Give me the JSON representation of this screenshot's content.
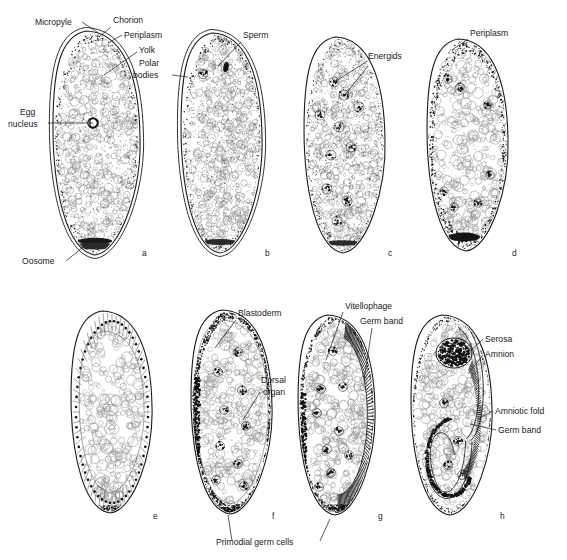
{
  "figure": {
    "background": "#ffffff",
    "ink": "#1a1a1a"
  },
  "panels": [
    {
      "id": "a",
      "letter": "a",
      "cx": 97,
      "cy": 143,
      "rx": 43,
      "ry": 112,
      "letter_x": 142,
      "letter_y": 256,
      "stage": "fertilized egg with egg nucleus and oosome"
    },
    {
      "id": "b",
      "letter": "b",
      "cx": 222,
      "cy": 143,
      "rx": 40,
      "ry": 110,
      "letter_x": 265,
      "letter_y": 256,
      "stage": "sperm entry and polar bodies"
    },
    {
      "id": "c",
      "letter": "c",
      "cx": 345,
      "cy": 145,
      "rx": 40,
      "ry": 108,
      "letter_x": 388,
      "letter_y": 256,
      "stage": "cleavage energids"
    },
    {
      "id": "d",
      "letter": "d",
      "cx": 468,
      "cy": 145,
      "rx": 40,
      "ry": 106,
      "letter_x": 512,
      "letter_y": 256,
      "stage": "energids migrate to periplasm"
    },
    {
      "id": "e",
      "letter": "e",
      "cx": 112,
      "cy": 412,
      "rx": 40,
      "ry": 101,
      "letter_x": 153,
      "letter_y": 519,
      "stage": "cellular blastoderm forming"
    },
    {
      "id": "f",
      "letter": "f",
      "cx": 232,
      "cy": 412,
      "rx": 40,
      "ry": 102,
      "letter_x": 272,
      "letter_y": 519,
      "stage": "blastoderm with primodial germ cells"
    },
    {
      "id": "g",
      "letter": "g",
      "cx": 337,
      "cy": 415,
      "rx": 38,
      "ry": 100,
      "letter_x": 378,
      "letter_y": 519,
      "stage": "germ band and dorsal organ"
    },
    {
      "id": "h",
      "letter": "h",
      "cx": 452,
      "cy": 415,
      "rx": 40,
      "ry": 100,
      "letter_x": 500,
      "letter_y": 519,
      "stage": "amniotic folds, serosa and amnion"
    }
  ],
  "labels": [
    {
      "id": "micropyle",
      "text": "Micropyle",
      "x": 35,
      "y": 25,
      "anchor": "start"
    },
    {
      "id": "chorion",
      "text": "Chorion",
      "x": 113,
      "y": 23,
      "anchor": "start"
    },
    {
      "id": "periplasm-a",
      "text": "Periplasm",
      "x": 124,
      "y": 38,
      "anchor": "start"
    },
    {
      "id": "yolk",
      "text": "Yolk",
      "x": 139,
      "y": 53,
      "anchor": "start"
    },
    {
      "id": "polar-l1",
      "text": "Polar",
      "x": 139,
      "y": 66,
      "anchor": "start"
    },
    {
      "id": "polar-l2",
      "text": "bodies",
      "x": 133,
      "y": 78,
      "anchor": "start"
    },
    {
      "id": "egg-l1",
      "text": "Egg",
      "x": 20,
      "y": 115,
      "anchor": "start"
    },
    {
      "id": "egg-l2",
      "text": "nucleus",
      "x": 8,
      "y": 127,
      "anchor": "start"
    },
    {
      "id": "oosome",
      "text": "Oosome",
      "x": 22,
      "y": 264,
      "anchor": "start"
    },
    {
      "id": "sperm",
      "text": "Sperm",
      "x": 243,
      "y": 38,
      "anchor": "start"
    },
    {
      "id": "energids",
      "text": "Energids",
      "x": 368,
      "y": 59,
      "anchor": "start"
    },
    {
      "id": "periplasm-d",
      "text": "Periplasm",
      "x": 470,
      "y": 36,
      "anchor": "start"
    },
    {
      "id": "blastoderm",
      "text": "Blastoderm",
      "x": 238,
      "y": 316,
      "anchor": "start"
    },
    {
      "id": "dorsal-l1",
      "text": "Dorsal",
      "x": 261,
      "y": 383,
      "anchor": "start"
    },
    {
      "id": "dorsal-l2",
      "text": "organ",
      "x": 263,
      "y": 395,
      "anchor": "start"
    },
    {
      "id": "primodial",
      "text": "Primodial germ cells",
      "x": 216,
      "y": 545,
      "anchor": "start"
    },
    {
      "id": "vitellophage",
      "text": "Vitellophage",
      "x": 345,
      "y": 309,
      "anchor": "start"
    },
    {
      "id": "germband-g",
      "text": "Germ band",
      "x": 360,
      "y": 324,
      "anchor": "start"
    },
    {
      "id": "serosa",
      "text": "Serosa",
      "x": 485,
      "y": 342,
      "anchor": "start"
    },
    {
      "id": "amnion",
      "text": "Amnion",
      "x": 485,
      "y": 357,
      "anchor": "start"
    },
    {
      "id": "amniotic-fold",
      "text": "Amniotic fold",
      "x": 495,
      "y": 414,
      "anchor": "start"
    },
    {
      "id": "germband-h",
      "text": "Germ band",
      "x": 498,
      "y": 433,
      "anchor": "start"
    }
  ],
  "leaders": [
    {
      "id": "leader-micropyle",
      "d": "M 82,22 L 97,32"
    },
    {
      "id": "leader-chorion",
      "d": "M 111,27 L 100,36"
    },
    {
      "id": "leader-periplasm-a",
      "d": "M 122,35 L 108,43"
    },
    {
      "id": "leader-yolk",
      "d": "M 137,52 L 104,75"
    },
    {
      "id": "leader-polar",
      "d": "M 172,75 L 188,77"
    },
    {
      "id": "leader-egg",
      "d": "M 48,123 L 93,123"
    },
    {
      "id": "leader-oosome",
      "d": "M 66,261 L 88,243"
    },
    {
      "id": "leader-sperm",
      "d": "M 241,42 L 218,66"
    },
    {
      "id": "leader-energids-1",
      "d": "M 366,62 L 334,82"
    },
    {
      "id": "leader-energids-2",
      "d": "M 368,66 L 344,96"
    },
    {
      "id": "leader-periplasm-d",
      "d": "M 468,39 L 452,50"
    },
    {
      "id": "leader-blastoderm",
      "d": "M 236,320 L 215,348"
    },
    {
      "id": "leader-dorsal",
      "d": "M 260,392 L 243,420"
    },
    {
      "id": "leader-primodial-f",
      "d": "M 232,541 L 228,515"
    },
    {
      "id": "leader-primodial-g",
      "d": "M 320,541 L 330,519"
    },
    {
      "id": "leader-vitellophage",
      "d": "M 343,312 L 326,360"
    },
    {
      "id": "leader-germband-g",
      "d": "M 372,328 L 364,380"
    },
    {
      "id": "leader-serosa",
      "d": "M 483,339 L 463,358"
    },
    {
      "id": "leader-amnion",
      "d": "M 483,355 L 468,374"
    },
    {
      "id": "leader-amniotic",
      "d": "M 493,411 L 478,419"
    },
    {
      "id": "leader-germband-h",
      "d": "M 496,430 L 470,424"
    }
  ]
}
